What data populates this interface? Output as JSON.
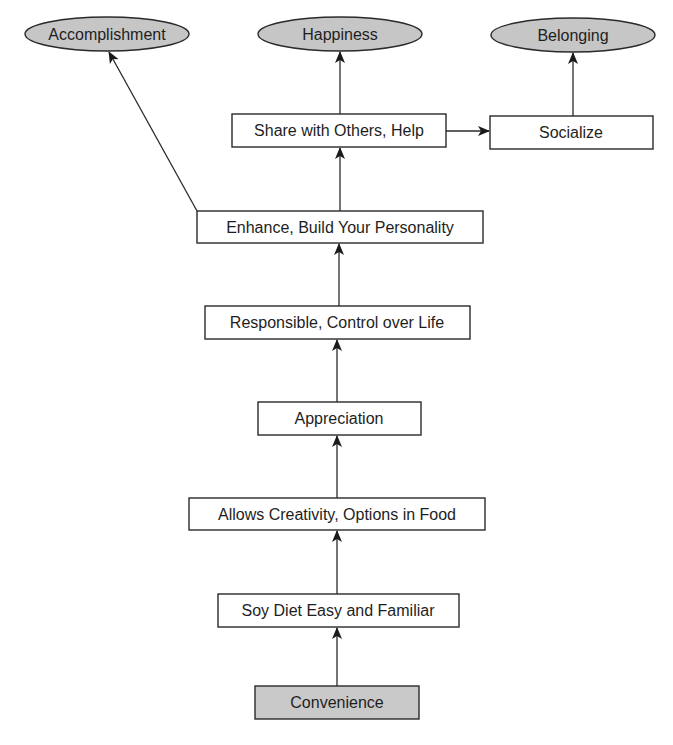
{
  "diagram": {
    "type": "means-end ladder",
    "colors": {
      "background": "#ffffff",
      "box_fill": "#ffffff",
      "shaded_fill": "#c9c9c9",
      "ellipse_fill": "#c6c6c6",
      "stroke": "#2a2a2a",
      "text": "#1e1e1e"
    },
    "nodes": {
      "accomplishment": {
        "label": "Accomplishment",
        "shape": "ellipse",
        "kind": "value"
      },
      "happiness": {
        "label": "Happiness",
        "shape": "ellipse",
        "kind": "value"
      },
      "belonging": {
        "label": "Belonging",
        "shape": "ellipse",
        "kind": "value"
      },
      "share": {
        "label": "Share with Others, Help",
        "shape": "box",
        "kind": "consequence"
      },
      "socialize": {
        "label": "Socialize",
        "shape": "box",
        "kind": "consequence"
      },
      "enhance": {
        "label": "Enhance, Build Your Personality",
        "shape": "box",
        "kind": "consequence"
      },
      "responsible": {
        "label": "Responsible, Control over Life",
        "shape": "box",
        "kind": "consequence"
      },
      "appreciation": {
        "label": "Appreciation",
        "shape": "box",
        "kind": "consequence"
      },
      "creativity": {
        "label": "Allows Creativity, Options in Food",
        "shape": "box",
        "kind": "consequence"
      },
      "soy_diet": {
        "label": "Soy Diet Easy and Familiar",
        "shape": "box",
        "kind": "consequence"
      },
      "convenience": {
        "label": "Convenience",
        "shape": "box-shaded",
        "kind": "attribute"
      }
    },
    "edges": [
      {
        "from": "convenience",
        "to": "soy_diet"
      },
      {
        "from": "soy_diet",
        "to": "creativity"
      },
      {
        "from": "creativity",
        "to": "appreciation"
      },
      {
        "from": "appreciation",
        "to": "responsible"
      },
      {
        "from": "responsible",
        "to": "enhance"
      },
      {
        "from": "enhance",
        "to": "share"
      },
      {
        "from": "enhance",
        "to": "accomplishment"
      },
      {
        "from": "share",
        "to": "happiness"
      },
      {
        "from": "share",
        "to": "socialize"
      },
      {
        "from": "socialize",
        "to": "belonging"
      }
    ]
  }
}
